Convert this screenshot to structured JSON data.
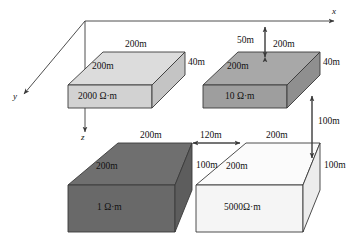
{
  "figure": {
    "type": "3d-block-model-diagram",
    "background_color": "#ffffff",
    "line_color": "#3a3a3a"
  },
  "axes": {
    "x_label": "x",
    "y_label": "y",
    "z_label": "z"
  },
  "blocks": [
    {
      "id": "block-2000",
      "resistivity_label": "2000 Ω·m",
      "width_label": "200m",
      "depth_label": "200m",
      "thickness_label": "40m",
      "fill_color": "#d6d6d6"
    },
    {
      "id": "block-10",
      "resistivity_label": "10 Ω·m",
      "width_label": "200m",
      "depth_label": "200m",
      "thickness_label": "40m",
      "burial_label": "50m",
      "fill_color": "#a5a5a5"
    },
    {
      "id": "block-1",
      "resistivity_label": "1 Ω·m",
      "width_label": "200m",
      "depth_label": "200m",
      "thickness_label": "100m",
      "fill_color": "#6e6e6e"
    },
    {
      "id": "block-5000",
      "resistivity_label": "5000Ω·m",
      "width_label": "200m",
      "depth_label": "200m",
      "thickness_label": "100m",
      "fill_color": "#f2f2f2"
    }
  ],
  "dimensions": {
    "gap_label": "120m",
    "depth_to_top_label": "100m"
  }
}
